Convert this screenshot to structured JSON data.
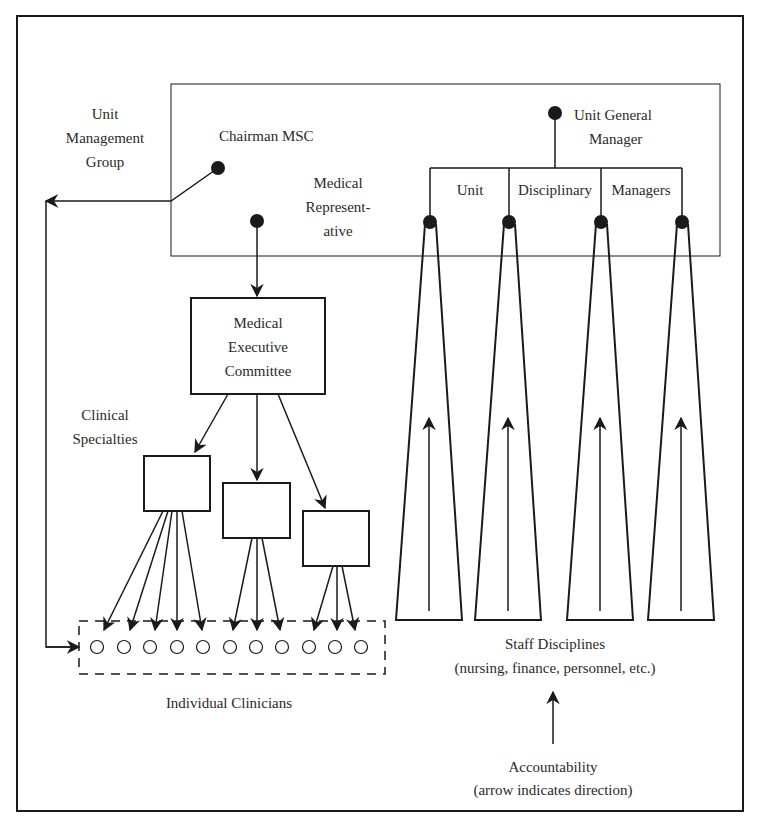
{
  "diagram": {
    "labels": {
      "unit_management_group": [
        "Unit",
        "Management",
        "Group"
      ],
      "chairman_msc": "Chairman MSC",
      "medical_representative": [
        "Medical",
        "Represent-",
        "ative"
      ],
      "unit_general_manager": [
        "Unit General",
        "Manager"
      ],
      "unit_disciplinary_managers": [
        "Unit",
        "Disciplinary",
        "Managers"
      ],
      "medical_executive_committee": [
        "Medical",
        "Executive",
        "Committee"
      ],
      "clinical_specialties": [
        "Clinical",
        "Specialties"
      ],
      "individual_clinicians": "Individual Clinicians",
      "staff_disciplines": [
        "Staff Disciplines",
        "(nursing, finance, personnel, etc.)"
      ],
      "accountability_legend": [
        "Accountability",
        "(arrow indicates direction)"
      ]
    },
    "counts": {
      "clinical_specialty_boxes": 3,
      "individual_clinician_nodes": 11,
      "staff_discipline_columns": 4
    },
    "colors": {
      "stroke": "#1a1a1a",
      "text": "#2a2a2a",
      "background": "#ffffff"
    }
  }
}
